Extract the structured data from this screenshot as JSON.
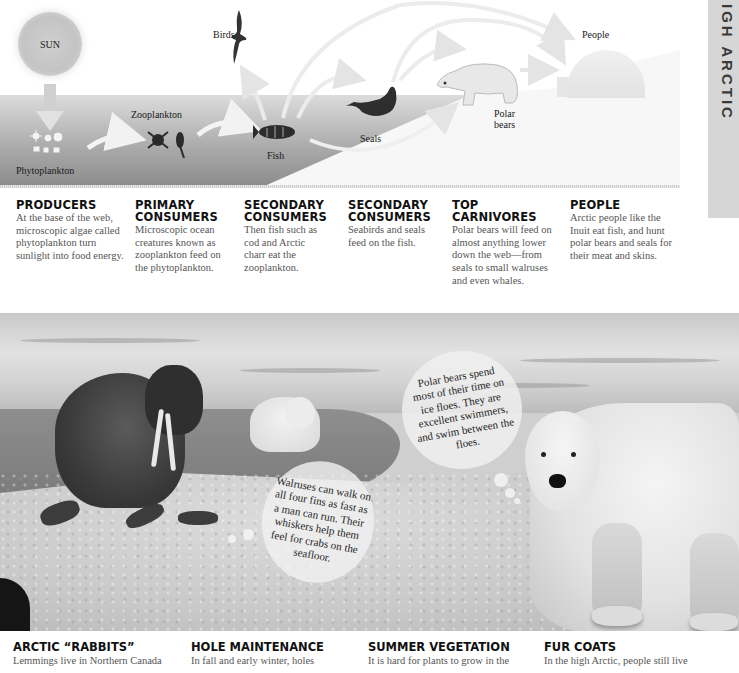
{
  "side_tab": {
    "label": "IGH ARCTIC"
  },
  "diagram": {
    "sun_label": "SUN",
    "labels": {
      "birds": "Birds",
      "people": "People",
      "zooplankton": "Zooplankton",
      "phytoplankton": "Phytoplankton",
      "fish": "Fish",
      "seals": "Seals",
      "polar_bears_line1": "Polar",
      "polar_bears_line2": "bears"
    },
    "colors": {
      "water_top": "#dcdcdc",
      "water_bottom": "#8d8d8d",
      "land": "#f7f7f7"
    }
  },
  "columns": [
    {
      "title": "PRODUCERS",
      "text": "At the base of the web, microscopic algae called phytoplankton turn sunlight into food energy."
    },
    {
      "title": "PRIMARY CONSUMERS",
      "text": "Microscopic ocean creatures known as zooplankton feed on the phytoplankton."
    },
    {
      "title": "SECONDARY CONSUMERS",
      "text": "Then fish such as cod and Arctic charr eat the zooplankton."
    },
    {
      "title": "SECONDARY CONSUMERS",
      "text": "Seabirds and seals feed on the fish."
    },
    {
      "title": "TOP CARNIVORES",
      "text": "Polar bears will feed on almost anything lower down the web—from seals to small walruses and even whales."
    },
    {
      "title": "PEOPLE",
      "text": "Arctic people like the Inuit eat fish, and hunt polar bears and seals for their meat and skins."
    }
  ],
  "photo": {
    "bubbles": [
      {
        "text": "Polar bears spend most of their time on ice floes. They are excellent swimmers, and swim between the floes."
      },
      {
        "text": "Walruses can walk on all four fins as fast as a man can run. Their whiskers help them feel for crabs on the seafloor."
      }
    ]
  },
  "bottom_sections": [
    {
      "title": "ARCTIC “RABBITS”",
      "text": "Lemmings live in Northern Canada"
    },
    {
      "title": "HOLE MAINTENANCE",
      "text": "In fall and early winter, holes"
    },
    {
      "title": "SUMMER VEGETATION",
      "text": "It is hard for plants to grow in the"
    },
    {
      "title": "FUR COATS",
      "text": "In the high Arctic, people still live"
    }
  ]
}
